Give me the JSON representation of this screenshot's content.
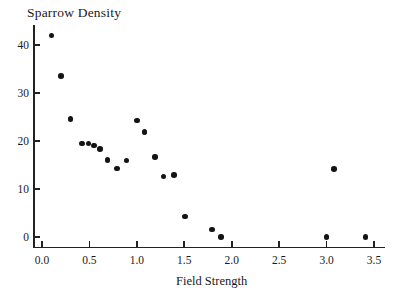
{
  "chart_data": {
    "type": "scatter",
    "title": "Sparrow Density",
    "ylabel": "Sparrow Density",
    "xlabel": "Field Strength",
    "xlim": [
      0,
      3.5
    ],
    "ylim": [
      0,
      44
    ],
    "grid": false,
    "legend": null,
    "marker": {
      "shape": "circle",
      "color": "#141414",
      "diameter_px": 5.6
    },
    "x_ticks": [
      {
        "v": 0.0,
        "label": "0.0"
      },
      {
        "v": 0.5,
        "label": "0.5"
      },
      {
        "v": 1.0,
        "label": "1.0"
      },
      {
        "v": 1.5,
        "label": "1.5"
      },
      {
        "v": 2.0,
        "label": "2.0"
      },
      {
        "v": 2.5,
        "label": "2.5"
      },
      {
        "v": 3.0,
        "label": "3.0"
      },
      {
        "v": 3.5,
        "label": "3.5"
      }
    ],
    "y_ticks": [
      {
        "v": 0,
        "label": "0"
      },
      {
        "v": 10,
        "label": "10"
      },
      {
        "v": 20,
        "label": "20"
      },
      {
        "v": 30,
        "label": "30"
      },
      {
        "v": 40,
        "label": "40"
      }
    ],
    "points": [
      [
        0.1,
        42.0
      ],
      [
        0.2,
        33.5
      ],
      [
        0.3,
        24.6
      ],
      [
        0.42,
        19.5
      ],
      [
        0.49,
        19.5
      ],
      [
        0.55,
        19.1
      ],
      [
        0.61,
        18.3
      ],
      [
        0.69,
        16.1
      ],
      [
        0.79,
        14.3
      ],
      [
        0.89,
        15.9
      ],
      [
        1.0,
        24.3
      ],
      [
        1.08,
        21.9
      ],
      [
        1.19,
        16.7
      ],
      [
        1.28,
        12.6
      ],
      [
        1.39,
        12.9
      ],
      [
        1.51,
        4.3
      ],
      [
        1.79,
        1.6
      ],
      [
        1.89,
        0.0
      ],
      [
        3.0,
        0.0
      ],
      [
        3.08,
        14.2
      ],
      [
        3.41,
        0.0
      ]
    ]
  }
}
